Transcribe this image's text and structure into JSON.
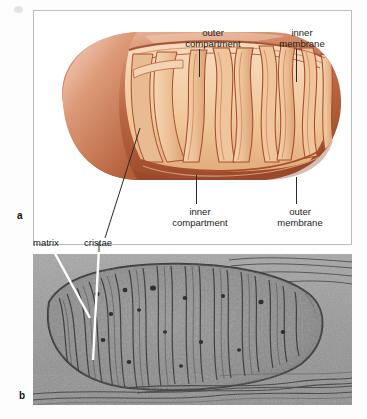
{
  "figure": {
    "panels": [
      {
        "letter": "a",
        "kind": "illustration",
        "description": "cut-away drawing of a mitochondrion"
      },
      {
        "letter": "b",
        "kind": "electron-micrograph",
        "description": "transmission electron micrograph of a mitochondrion"
      }
    ]
  },
  "panel_a": {
    "letter": "a",
    "labels": [
      {
        "id": "outer-compartment",
        "text": "outer\ncompartment",
        "line1": "outer",
        "line2": "compartment",
        "position": "top-center"
      },
      {
        "id": "inner-membrane",
        "text": "inner\nmembrane",
        "line1": "inner",
        "line2": "membrane",
        "position": "top-right"
      },
      {
        "id": "inner-compartment",
        "text": "inner\ncompartment",
        "line1": "inner",
        "line2": "compartment",
        "position": "bottom-center"
      },
      {
        "id": "outer-membrane",
        "text": "outer\nmembrane",
        "line1": "outer",
        "line2": "membrane",
        "position": "bottom-right"
      }
    ],
    "colors": {
      "outer_membrane": "#b5653f",
      "outer_membrane_highlight": "#e8b9a3",
      "matrix_fill": "#f0c79a",
      "cristae_fill": "#e8b184",
      "cristae_line": "#a8502c",
      "leader_line": "#2a2a2a",
      "frame": "#b9bcc0"
    }
  },
  "panel_b": {
    "letter": "b",
    "labels": [
      {
        "id": "matrix",
        "text": "matrix",
        "pointer": "white-line"
      },
      {
        "id": "cristae",
        "text": "cristae",
        "pointer": "white-line"
      }
    ],
    "colors": {
      "background": "#9a9a9a",
      "organelle": "#8d8d8d",
      "membrane_dark": "#3a3a3a",
      "pointer": "#ffffff"
    }
  }
}
